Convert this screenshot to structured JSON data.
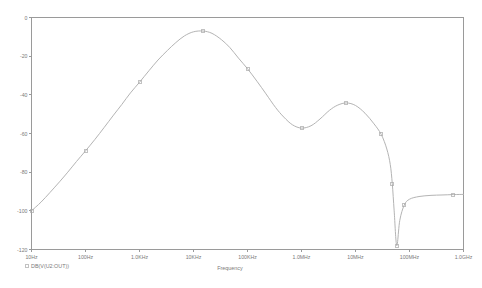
{
  "chart_data": {
    "type": "line",
    "title": "",
    "subtitle": "",
    "xlabel": "Frequency",
    "ylabel": "",
    "xscale": "log",
    "xlim": [
      10,
      1000000000
    ],
    "ylim": [
      -120,
      0
    ],
    "grid": false,
    "legend_position": "bottom-left",
    "y_tick_labels": [
      "0",
      "-20",
      "-40",
      "-60",
      "-80",
      "-100",
      "-120"
    ],
    "y_ticks": [
      0,
      -20,
      -40,
      -60,
      -80,
      -100,
      -120
    ],
    "x_tick_labels": [
      "10Hz",
      "100Hz",
      "1.0KHz",
      "10KHz",
      "100KHz",
      "1.0MHz",
      "10MHz",
      "100MHz",
      "1.0GHz"
    ],
    "x_ticks": [
      10,
      100,
      1000,
      10000,
      100000,
      1000000,
      10000000,
      100000000,
      1000000000
    ],
    "series": [
      {
        "name": "DB(V(U2:OUT))",
        "unit": "dB",
        "x": [
          10,
          15,
          22,
          33,
          47,
          68,
          100,
          150,
          220,
          330,
          470,
          680,
          1000,
          1500,
          2200,
          3300,
          4700,
          6800,
          10000,
          15000,
          22000,
          33000,
          47000,
          68000,
          100000,
          150000,
          220000,
          330000,
          470000,
          680000,
          1000000,
          1500000,
          2200000,
          3300000,
          4700000,
          6800000,
          10000000,
          15000000,
          22000000,
          30000000,
          38000000,
          44000000,
          48000000,
          52000000,
          58000000,
          66000000,
          80000000,
          100000000,
          150000000,
          250000000,
          400000000,
          650000000,
          1000000000
        ],
        "y": [
          -100.0,
          -95.5,
          -90.5,
          -85.0,
          -80.0,
          -74.5,
          -69.0,
          -63.0,
          -57.0,
          -50.5,
          -45.0,
          -39.0,
          -33.5,
          -27.5,
          -22.0,
          -17.0,
          -13.0,
          -9.5,
          -7.4,
          -7.0,
          -8.2,
          -11.5,
          -15.5,
          -21.0,
          -26.5,
          -33.0,
          -39.5,
          -46.5,
          -51.5,
          -55.5,
          -57.2,
          -56.0,
          -52.5,
          -48.0,
          -45.3,
          -44.2,
          -45.5,
          -49.5,
          -55.0,
          -60.5,
          -68.0,
          -76.0,
          -86.0,
          -100.0,
          -118.0,
          -105.0,
          -97.0,
          -94.0,
          -92.6,
          -92.0,
          -91.8,
          -91.6,
          -91.5
        ],
        "markers": [
          {
            "x": 10,
            "y": -100.0
          },
          {
            "x": 100,
            "y": -69.0
          },
          {
            "x": 1000,
            "y": -33.5
          },
          {
            "x": 15000,
            "y": -7.0
          },
          {
            "x": 100000,
            "y": -26.5
          },
          {
            "x": 1000000,
            "y": -57.2
          },
          {
            "x": 6800000,
            "y": -44.2
          },
          {
            "x": 30000000,
            "y": -60.5
          },
          {
            "x": 48000000,
            "y": -86.0
          },
          {
            "x": 58000000,
            "y": -118.0
          },
          {
            "x": 80000000,
            "y": -97.0
          },
          {
            "x": 650000000,
            "y": -91.6
          }
        ]
      }
    ]
  },
  "legend": {
    "entries": [
      {
        "label": "DB(V(U2:OUT))",
        "marker": "square-marker"
      }
    ]
  },
  "axes": {
    "x_title": "Frequency",
    "y_title": ""
  }
}
